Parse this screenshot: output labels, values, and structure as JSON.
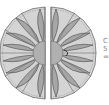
{
  "diagram": {
    "type": "split-dodecagon-rosette",
    "colors": {
      "polygon_fill": "#d4d4d4",
      "polygon_stroke": "#6e6e6e",
      "petal_fill": "#9e9e9e",
      "petal_stroke": "#4a4a4a",
      "center_fill": "#b0b0b0",
      "dashed_edge": "#8a8a8a"
    },
    "left_half": {
      "petal_count": 6
    },
    "right_half": {
      "petal_count": 6
    },
    "side_text_fragment": "C\n5\n="
  }
}
